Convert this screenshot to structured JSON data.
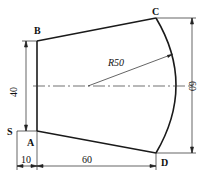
{
  "diagram": {
    "type": "engineering-drawing",
    "points": {
      "A": "A",
      "B": "B",
      "C": "C",
      "D": "D",
      "S": "S"
    },
    "dimensions": {
      "left_height": "40",
      "right_height": "60",
      "bottom_offset": "10",
      "bottom_length": "60",
      "radius": "R50"
    },
    "colors": {
      "line": "#1a1a1a",
      "background": "#ffffff"
    }
  }
}
